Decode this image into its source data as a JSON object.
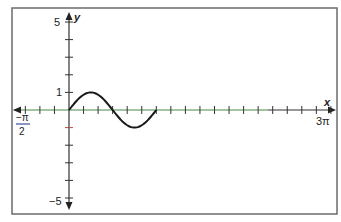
{
  "chart_data": {
    "type": "line",
    "title": "",
    "xlabel": "x",
    "ylabel": "y",
    "xlim_label": [
      "-π/2",
      "3π"
    ],
    "xlim": [
      -1.5708,
      9.4248
    ],
    "ylim": [
      -5,
      5
    ],
    "x_tick_step": "π/6",
    "x_tick_labels": [
      {
        "value": -1.5708,
        "label_num": "−π",
        "label_den": "2"
      },
      {
        "value": 9.4248,
        "label": "3π"
      }
    ],
    "y_tick_step": 1,
    "y_tick_labels": [
      {
        "value": 5,
        "label": "5"
      },
      {
        "value": 1,
        "label": "1"
      },
      {
        "value": -5,
        "label": "−5"
      }
    ],
    "grid": false,
    "legend": null,
    "series": [
      {
        "name": "y = sin(2x)",
        "function": "sin(2x)",
        "domain": [
          0,
          3.1416
        ],
        "x": [
          0,
          0.3927,
          0.7854,
          1.1781,
          1.5708,
          1.9635,
          2.3562,
          2.7489,
          3.1416
        ],
        "y": [
          0,
          0.707,
          1,
          0.707,
          0,
          -0.707,
          -1,
          -0.707,
          0
        ],
        "color": "#1a1a1a"
      }
    ]
  },
  "labels": {
    "y_axis": "y",
    "x_axis": "x",
    "y_max": "5",
    "y_one": "1",
    "y_min": "−5",
    "x_min_num": "−π",
    "x_min_den": "2",
    "x_max": "3π"
  },
  "colors": {
    "frame": "#6b6b6b",
    "axis_x": "#4a8a4a",
    "axis_y": "#333333",
    "curve": "#1a1a1a",
    "accent_tick": "#b84a4a",
    "fraction_bar": "#3a4fa0"
  }
}
